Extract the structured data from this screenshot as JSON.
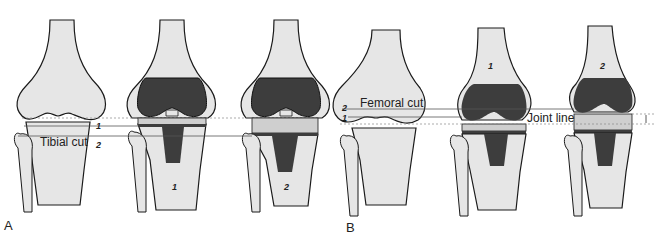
{
  "figure": {
    "colors": {
      "bone": "#e6e6e6",
      "bone_outline": "#1a1a1a",
      "implant_dark": "#3d3d3d",
      "spacer": "#cfcfcf",
      "guide_line": "#555555"
    },
    "panel_a": {
      "label": "A",
      "cut_label": "Tibial cut",
      "line_markers": [
        "1",
        "2"
      ],
      "knees": [
        {
          "id": "native",
          "number": ""
        },
        {
          "id": "tka-1",
          "number": "1"
        },
        {
          "id": "tka-2",
          "number": "2"
        }
      ]
    },
    "panel_b": {
      "label": "B",
      "cut_label": "Femoral cut",
      "joint_line_label": "Joint line",
      "line_markers": [
        "2",
        "1"
      ],
      "knees": [
        {
          "id": "native",
          "number": ""
        },
        {
          "id": "tka-1",
          "number": "1"
        },
        {
          "id": "tka-2",
          "number": "2"
        }
      ]
    }
  }
}
